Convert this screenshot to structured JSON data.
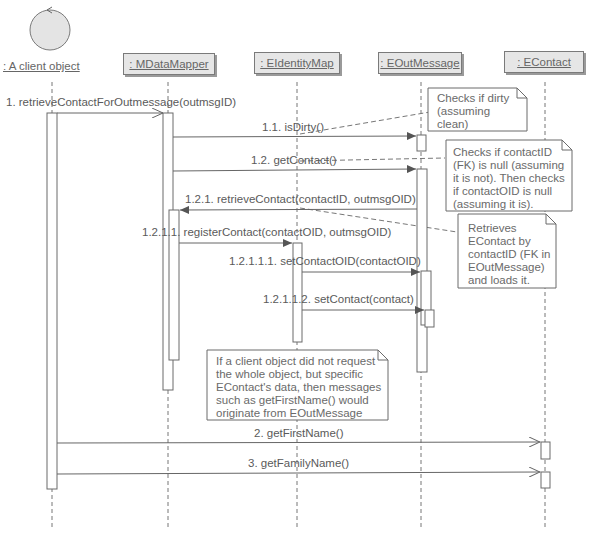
{
  "diagram": {
    "type": "UML sequence diagram",
    "participants": [
      {
        "id": "client",
        "label": ": A client object",
        "kind": "actor"
      },
      {
        "id": "mapper",
        "label": ": MDataMapper",
        "kind": "object"
      },
      {
        "id": "idmap",
        "label": ": EIdentityMap",
        "kind": "object"
      },
      {
        "id": "outmsg",
        "label": ": EOutMessage",
        "kind": "object"
      },
      {
        "id": "contact",
        "label": ": EContact",
        "kind": "object"
      }
    ],
    "messages": [
      {
        "label": "1. retrieveContactForOutmessage(outmsgID)",
        "from": "client",
        "to": "mapper"
      },
      {
        "label": "1.1. isDirty()",
        "from": "mapper",
        "to": "outmsg"
      },
      {
        "label": "1.2. getContact()",
        "from": "mapper",
        "to": "outmsg"
      },
      {
        "label": "1.2.1. retrieveContact(contactID, outmsgOID)",
        "from": "outmsg",
        "to": "mapper"
      },
      {
        "label": "1.2.1.1. registerContact(contactOID, outmsgOID)",
        "from": "mapper",
        "to": "idmap"
      },
      {
        "label": "1.2.1.1.1. setContactOID(contactOID)",
        "from": "idmap",
        "to": "outmsg"
      },
      {
        "label": "1.2.1.1.2. setContact(contact)",
        "from": "idmap",
        "to": "outmsg"
      },
      {
        "label": "2. getFirstName()",
        "from": "client",
        "to": "contact"
      },
      {
        "label": "3. getFamilyName()",
        "from": "client",
        "to": "contact"
      }
    ],
    "notes": [
      {
        "text": "Checks if dirty\n(assuming\nclean)"
      },
      {
        "text": "Checks if contactID\n(FK) is null (assuming\nit is not). Then checks\nif contactOID is null\n(assuming it is)."
      },
      {
        "text": "Retrieves\nEContact by\ncontactID (FK in\nEOutMessage)\nand loads it."
      },
      {
        "text": "If a client object did not request\nthe whole object, but specific\nEContact's data, then messages\nsuch as getFirstName() would\noriginate from EOutMessage"
      }
    ],
    "colors": {
      "line": "#6a6a6a",
      "box_fill": "#e6e6e6",
      "text": "#5a5a5a"
    }
  }
}
